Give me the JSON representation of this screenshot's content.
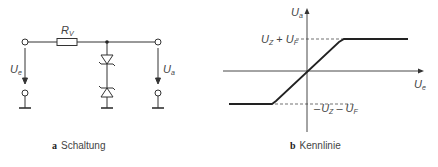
{
  "circuit": {
    "resistor_label": "R",
    "resistor_sub": "V",
    "input_label": "U",
    "input_sub": "e",
    "output_label": "U",
    "output_sub": "a",
    "caption_letter": "a",
    "caption_text": "Schaltung"
  },
  "graph": {
    "y_axis_label": "U",
    "y_axis_sub": "a",
    "x_axis_label": "U",
    "x_axis_sub": "e",
    "upper_level": {
      "p1": "U",
      "s1": "Z",
      "op": " + ",
      "p2": "U",
      "s2": "F"
    },
    "lower_level": {
      "p0": "–",
      "p1": "U",
      "s1": "Z",
      "op": " – ",
      "p2": "U",
      "s2": "F"
    },
    "caption_letter": "b",
    "caption_text": "Kennlinie"
  },
  "colors": {
    "line": "#333333",
    "text": "#444444"
  }
}
